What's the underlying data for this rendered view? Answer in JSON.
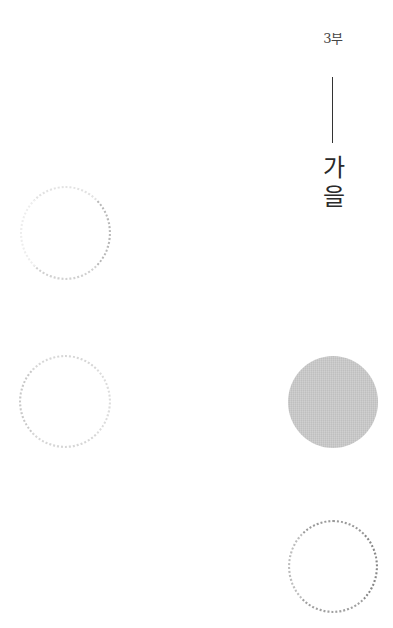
{
  "page": {
    "part_label": "3부",
    "title_chars": [
      "가",
      "을"
    ]
  },
  "decorations": {
    "circles": [
      {
        "style": "dotted",
        "color": "#c4c4c4",
        "position": "left-upper"
      },
      {
        "style": "dotted",
        "color": "#d0d0d0",
        "position": "left-middle"
      },
      {
        "style": "filled",
        "color": "#c9c9c9",
        "position": "right-middle"
      },
      {
        "style": "dotted",
        "color": "#959595",
        "position": "right-lower"
      }
    ],
    "divider_color": "#333333"
  }
}
